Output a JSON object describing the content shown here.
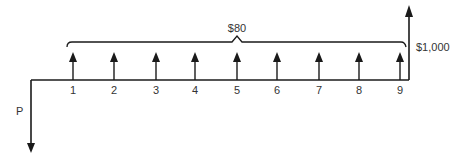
{
  "diagram": {
    "type": "cash-flow-diagram",
    "present_value_label": "P",
    "annuity_label": "$80",
    "final_payment_label": "$1,000",
    "periods": [
      "1",
      "2",
      "3",
      "4",
      "5",
      "6",
      "7",
      "8",
      "9"
    ],
    "colors": {
      "line": "#1a1a1a",
      "text": "#333333",
      "background": "#ffffff"
    }
  }
}
